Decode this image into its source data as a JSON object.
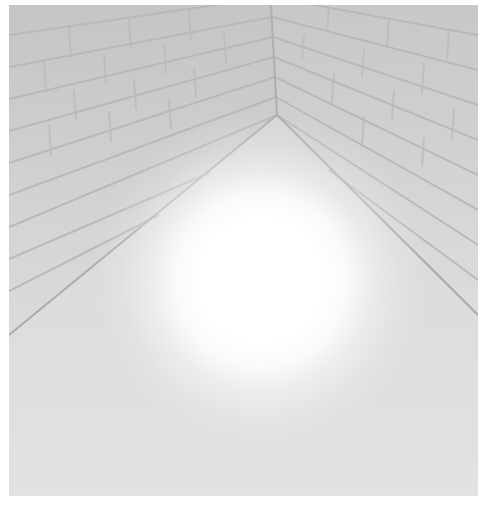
{
  "scene": {
    "description": "Rendered view looking up into a brick-walled corner with a bright glowing light sphere",
    "colors": {
      "background": "#ffffff",
      "wall_base": "#d8d8d8",
      "mortar": "#b4b4b4",
      "glow_core": "#ffffff"
    },
    "corner_apex": {
      "x": 262,
      "y": 0
    },
    "glow": {
      "cx": 252,
      "cy": 275,
      "radius": 90
    }
  }
}
